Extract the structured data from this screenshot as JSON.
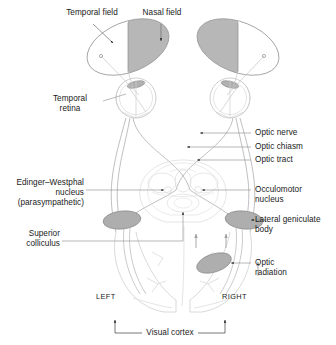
{
  "figure": {
    "colors": {
      "outline": "#b9b9b9",
      "outline_dark": "#8f8f8f",
      "shade_field": "#b3b3b3",
      "shade_nucleus": "#a9a9a9",
      "leader": "#9a9a9a",
      "text": "#1a1a1a",
      "background": "#ffffff"
    }
  },
  "labels": {
    "temporal_field": "Temporal field",
    "nasal_field": "Nasal field",
    "temporal_retina": "Temporal\nretina",
    "optic_nerve": "Optic nerve",
    "optic_chiasm": "Optic chiasm",
    "optic_tract": "Optic tract",
    "edinger_westphal": "Edinger–Westphal\nnucleus\n(parasympathetic)",
    "occulomotor_nucleus": "Occulomotor\nnucleus",
    "superior_colliculus": "Superior\ncolliculus",
    "lateral_geniculate_body": "Lateral geniculate\nbody",
    "optic_radiation": "Optic\nradiation",
    "left": "LEFT",
    "right": "RIGHT",
    "visual_cortex": "Visual cortex"
  },
  "structures": {
    "visual_fields": [
      {
        "side": "left",
        "shaded_half": "right",
        "shaded_label": "nasal",
        "unshaded_label": "temporal"
      },
      {
        "side": "right",
        "shaded_half": "left",
        "shaded_label": "nasal",
        "unshaded_label": "temporal"
      }
    ],
    "eyes": [
      {
        "side": "left"
      },
      {
        "side": "right"
      }
    ],
    "geniculate_bodies": [
      {
        "side": "left"
      },
      {
        "side": "right"
      }
    ],
    "optic_radiation_body": {
      "side": "right"
    },
    "hemispheres": [
      {
        "label_key": "left"
      },
      {
        "label_key": "right"
      }
    ]
  }
}
